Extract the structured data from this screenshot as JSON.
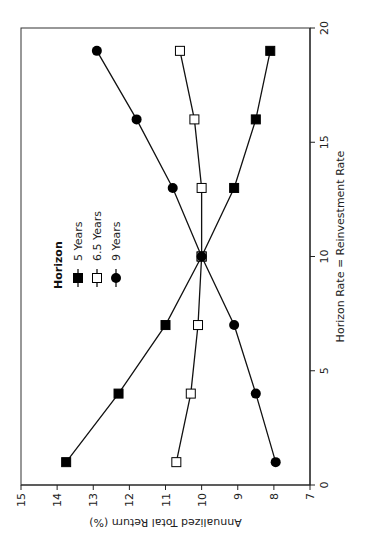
{
  "chart_data": {
    "type": "line",
    "orientation": "rotated-90-ccw",
    "title": "",
    "xlabel": "Horizon Rate = Reinvestment Rate",
    "ylabel": "Annualized Total Return (%)",
    "xlim": [
      0,
      20
    ],
    "ylim": [
      7,
      15
    ],
    "xticks": [
      0,
      5,
      10,
      15,
      20
    ],
    "yticks": [
      7,
      8,
      9,
      10,
      11,
      12,
      13,
      14,
      15
    ],
    "grid": false,
    "legend": {
      "title": "Horizon",
      "position": "upper-left (rotated frame)",
      "entries": [
        "5 Years",
        "6.5 Years",
        "9 Years"
      ]
    },
    "x": [
      1,
      4,
      7,
      10,
      13,
      16,
      19
    ],
    "series": [
      {
        "name": "5 Years",
        "marker": "filled-square",
        "values": [
          13.75,
          12.3,
          11.0,
          10.0,
          9.1,
          8.5,
          8.1
        ]
      },
      {
        "name": "6.5 Years",
        "marker": "open-square",
        "values": [
          10.7,
          10.3,
          10.1,
          10.0,
          10.0,
          10.2,
          10.6
        ]
      },
      {
        "name": "9 Years",
        "marker": "filled-circle",
        "values": [
          7.95,
          8.5,
          9.1,
          10.0,
          10.8,
          11.8,
          12.9
        ]
      }
    ]
  }
}
